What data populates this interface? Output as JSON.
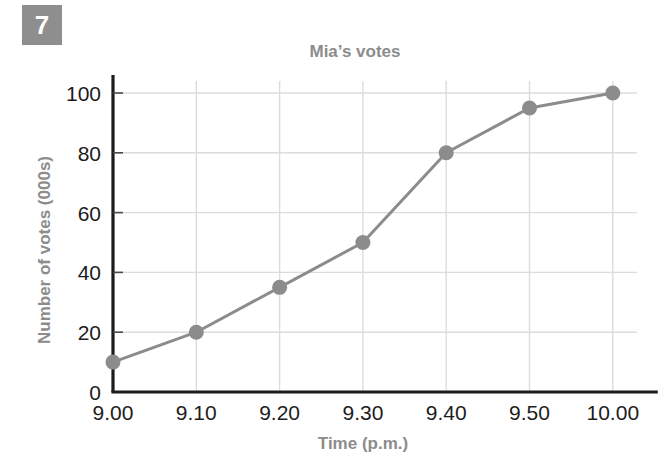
{
  "badge": {
    "number": "7"
  },
  "chart_data": {
    "type": "line",
    "title": "Mia’s votes",
    "xlabel": "Time (p.m.)",
    "ylabel": "Number of votes (000s)",
    "categories": [
      "9.00",
      "9.10",
      "9.20",
      "9.30",
      "9.40",
      "9.50",
      "10.00"
    ],
    "values": [
      10,
      20,
      35,
      50,
      80,
      95,
      100
    ],
    "series": [
      {
        "name": "Mia’s votes",
        "values": [
          10,
          20,
          35,
          50,
          80,
          95,
          100
        ]
      }
    ],
    "y_ticks": [
      "0",
      "20",
      "40",
      "60",
      "80",
      "100"
    ],
    "y_tick_values": [
      0,
      20,
      40,
      60,
      80,
      100
    ],
    "x_ticks": [
      "9.00",
      "9.10",
      "9.20",
      "9.30",
      "9.40",
      "9.50",
      "10.00"
    ],
    "ylim": [
      0,
      108
    ],
    "xlim": [
      0,
      6
    ],
    "grid": true,
    "legend": "none",
    "markers": "circle",
    "colors": {
      "line": "#8c8c8c",
      "marker": "#8c8c8c",
      "grid": "#dcdcdc",
      "axis": "#1c1c1c",
      "title_text": "#8c8c8c",
      "tick_text": "#1c1c1c",
      "badge_bg": "#8e8e8e",
      "badge_text": "#ffffff"
    }
  }
}
